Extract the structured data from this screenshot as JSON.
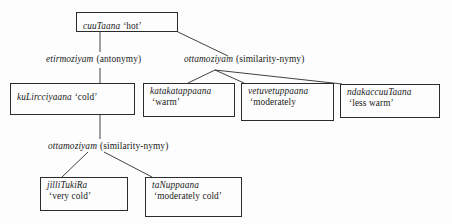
{
  "diagram": {
    "type": "tree",
    "ink_color": "#2b2b2b",
    "background_color": "#fdfdfd"
  },
  "nodes": {
    "root": {
      "term": "cuuTaana",
      "gloss": "‘hot’"
    },
    "cold": {
      "term": "kuLircciyaana",
      "gloss": "‘cold’"
    },
    "warm": {
      "term": "katakatappaana",
      "gloss": "‘warm’"
    },
    "moderately_warm": {
      "term": "vetuvetuppaana",
      "gloss": "‘moderately"
    },
    "less_warm": {
      "term": "ndakaccuuTaana",
      "gloss": "‘less warm’"
    },
    "very_cold": {
      "term": "jilliTukiRa",
      "gloss": "‘very cold’"
    },
    "moderately_cold": {
      "term": "taNuppaana",
      "gloss": "‘moderately cold’"
    }
  },
  "edge_labels": {
    "antonymy": {
      "relation": "etirmoziyam",
      "gloss": "(antonymy)"
    },
    "similarity_top": {
      "relation": "ottamoziyam",
      "gloss": "(similarity-nymy)"
    },
    "similarity_bottom": {
      "relation": "ottamoziyam",
      "gloss": "(similarity-nymy)"
    }
  }
}
